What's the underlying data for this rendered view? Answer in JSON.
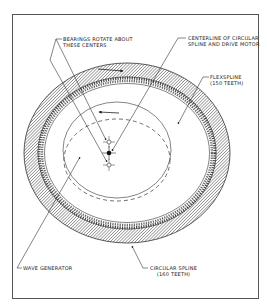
{
  "diagram": {
    "type": "harmonic-drive-cross-section",
    "colors": {
      "line": "#333333",
      "frame": "#555555",
      "hatch": "#444444",
      "background": "#ffffff"
    },
    "labels": {
      "bearings": {
        "line1": "BEARINGS ROTATE ABOUT",
        "line2": "THESE CENTERS"
      },
      "centerline": {
        "line1": "CENTERLINE OF CIRCULAR",
        "line2": "SPLINE AND DRIVE MOTOR"
      },
      "flexspline": {
        "line1": "FLEXSPLINE",
        "line2": "(150 TEETH)"
      },
      "wave_generator": {
        "line1": "WAVE GENERATOR"
      },
      "circular_spline": {
        "line1": "CIRCULAR SPLINE",
        "line2": "(160 TEETH)"
      }
    },
    "components": [
      {
        "name": "Circular spline",
        "teeth": 160
      },
      {
        "name": "Flexspline",
        "teeth": 150
      },
      {
        "name": "Wave generator"
      }
    ]
  }
}
